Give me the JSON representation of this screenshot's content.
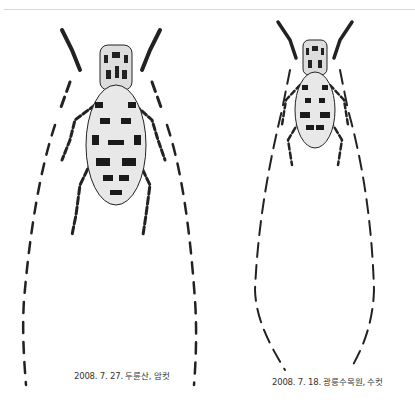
{
  "figure": {
    "specimens": [
      {
        "caption": "2008. 7. 27. 두륜산, 암컷",
        "sex": "female"
      },
      {
        "caption": "2008. 7. 18. 광릉수목원, 수컷",
        "sex": "male"
      }
    ]
  }
}
